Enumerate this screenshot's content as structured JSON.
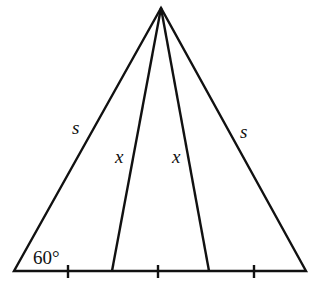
{
  "diagram": {
    "labels": {
      "left_side": "s",
      "right_side": "s",
      "left_cevian": "x",
      "right_cevian": "x",
      "angle": "60°"
    },
    "stroke_color": "#111111",
    "base_tick_marks": 3
  }
}
